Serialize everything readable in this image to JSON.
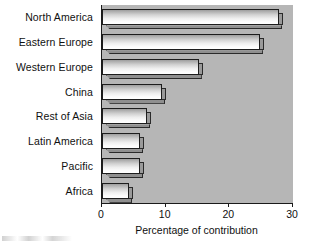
{
  "chart_data": {
    "type": "bar",
    "orientation": "horizontal",
    "title": "",
    "xlabel": "Percentage of contribution",
    "ylabel": "",
    "xlim": [
      0,
      30
    ],
    "xticks": [
      0,
      10,
      20,
      30
    ],
    "xtick_labels": [
      "0",
      "10",
      "20",
      "30"
    ],
    "grid": false,
    "legend": false,
    "categories": [
      "North America",
      "Eastern Europe",
      "Western Europe",
      "China",
      "Rest of Asia",
      "Latin America",
      "Pacific",
      "Africa"
    ],
    "values": [
      27.8,
      24.8,
      15.2,
      9.5,
      7.1,
      6.0,
      6.0,
      4.3
    ],
    "colors": {
      "plot_background": "#b6b6b6",
      "bar_face_light": "#ffffff",
      "bar_face_dark": "#9e9e9e",
      "bar_outline": "#1d1d1d",
      "axis": "#1a1a1a",
      "text": "#101010",
      "page_background": "#ffffff"
    }
  }
}
